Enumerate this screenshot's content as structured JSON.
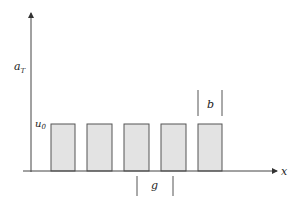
{
  "diagram": {
    "title": "",
    "y_axis": {
      "label_main": "a",
      "label_sub": "T"
    },
    "x_axis": {
      "label": "x"
    },
    "level": {
      "label_main": "u",
      "label_sub": "0"
    },
    "width_marker": {
      "label": "b"
    },
    "gap_marker": {
      "label": "g"
    },
    "bars": [
      {
        "x": 51,
        "w": 24
      },
      {
        "x": 87,
        "w": 25
      },
      {
        "x": 124,
        "w": 25
      },
      {
        "x": 161,
        "w": 25
      },
      {
        "x": 198,
        "w": 24
      }
    ],
    "colors": {
      "bar_fill": "#e3e3e3",
      "bar_stroke": "#555555",
      "axis": "#444444",
      "text": "#222222"
    }
  }
}
